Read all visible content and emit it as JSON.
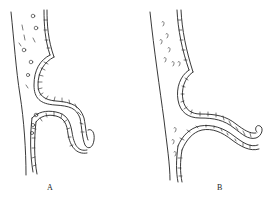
{
  "figure": {
    "type": "anatomical line illustration",
    "panels": [
      {
        "id": "A",
        "label": "A"
      },
      {
        "id": "B",
        "label": "B"
      }
    ],
    "colors": {
      "line": "#222222",
      "background": "#ffffff"
    }
  }
}
